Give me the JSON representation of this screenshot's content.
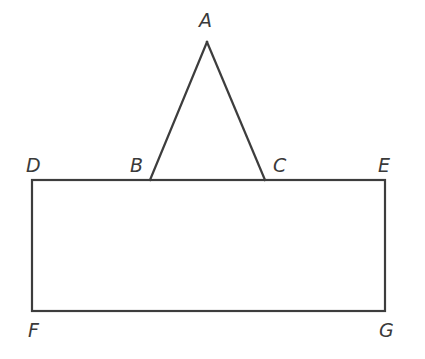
{
  "diagram": {
    "type": "geometry",
    "stroke_color": "#3d3d3d",
    "label_color": "#3a3a3a",
    "points": {
      "A": {
        "label": "A",
        "x": 207,
        "y": 42
      },
      "B": {
        "label": "B",
        "x": 150,
        "y": 180
      },
      "C": {
        "label": "C",
        "x": 265,
        "y": 180
      },
      "D": {
        "label": "D",
        "x": 32,
        "y": 180
      },
      "E": {
        "label": "E",
        "x": 385,
        "y": 180
      },
      "F": {
        "label": "F",
        "x": 32,
        "y": 311
      },
      "G": {
        "label": "G",
        "x": 385,
        "y": 311
      }
    },
    "shapes": [
      {
        "name": "triangle",
        "vertices": [
          "A",
          "B",
          "C"
        ]
      },
      {
        "name": "rectangle",
        "vertices": [
          "D",
          "E",
          "G",
          "F"
        ]
      }
    ],
    "labels": {
      "A": "A",
      "B": "B",
      "C": "C",
      "D": "D",
      "E": "E",
      "F": "F",
      "G": "G"
    }
  }
}
